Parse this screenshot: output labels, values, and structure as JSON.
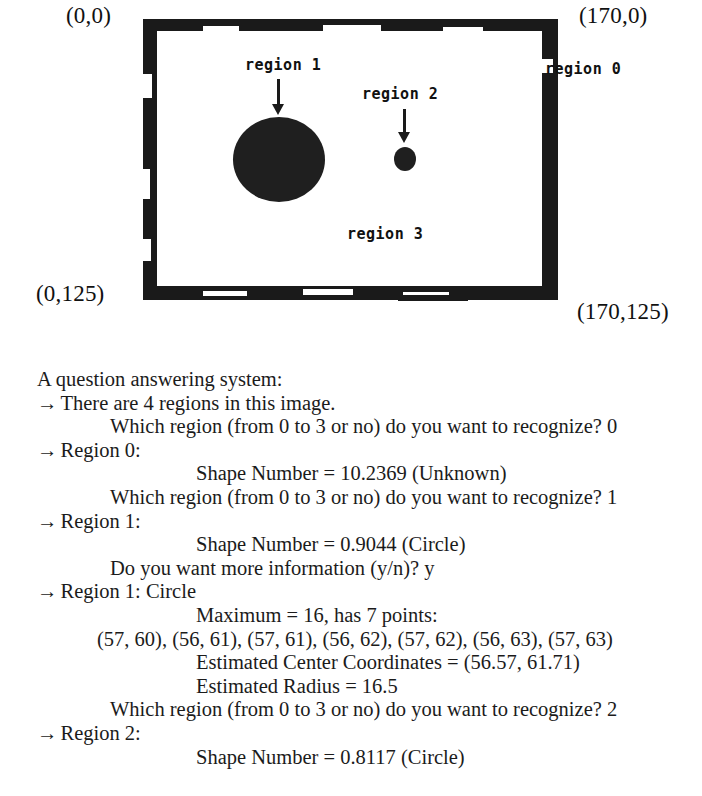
{
  "figure": {
    "corner_labels": {
      "top_left": "(0,0)",
      "top_right": "(170,0)",
      "bottom_left": "(0,125)",
      "bottom_right": "(170,125)"
    },
    "annotations": {
      "region0": "region 0",
      "region1": "region 1",
      "region2": "region 2",
      "region3": "region 3"
    },
    "colors": {
      "ink": "#1a1a1a",
      "paper": "#ffffff"
    }
  },
  "transcript": {
    "title": "A question answering system:",
    "lines": [
      {
        "indent": "ind-1",
        "arrow": true,
        "text": "There are 4 regions in this image."
      },
      {
        "indent": "ind-2",
        "arrow": false,
        "text": "Which region (from 0 to 3 or no) do you want to recognize? 0"
      },
      {
        "indent": "ind-1",
        "arrow": true,
        "text": "Region 0:"
      },
      {
        "indent": "ind-3",
        "arrow": false,
        "text": "Shape Number = 10.2369 (Unknown)"
      },
      {
        "indent": "ind-2",
        "arrow": false,
        "text": "Which region (from 0 to 3 or no) do you want to recognize? 1"
      },
      {
        "indent": "ind-1",
        "arrow": true,
        "text": "Region 1:"
      },
      {
        "indent": "ind-3",
        "arrow": false,
        "text": "Shape Number = 0.9044 (Circle)"
      },
      {
        "indent": "ind-2",
        "arrow": false,
        "text": "Do you want more information (y/n)? y"
      },
      {
        "indent": "ind-1",
        "arrow": true,
        "text": "Region 1: Circle"
      },
      {
        "indent": "ind-3",
        "arrow": false,
        "text": "Maximum = 16, has 7 points:"
      },
      {
        "indent": "ind-pts",
        "arrow": false,
        "text": "(57, 60), (56, 61), (57, 61), (56, 62), (57, 62), (56, 63), (57, 63)"
      },
      {
        "indent": "ind-3",
        "arrow": false,
        "text": "Estimated Center Coordinates = (56.57, 61.71)"
      },
      {
        "indent": "ind-3",
        "arrow": false,
        "text": "Estimated Radius = 16.5"
      },
      {
        "indent": "ind-2",
        "arrow": false,
        "text": "Which region (from 0 to 3 or no) do you want to recognize? 2"
      },
      {
        "indent": "ind-1",
        "arrow": true,
        "text": "Region 2:"
      },
      {
        "indent": "ind-3",
        "arrow": false,
        "text": "Shape Number = 0.8117 (Circle)"
      }
    ],
    "arrow_glyph": "→"
  }
}
